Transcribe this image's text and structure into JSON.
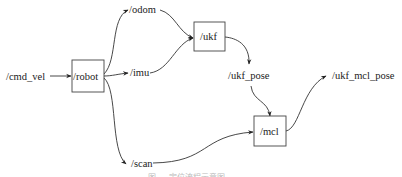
{
  "diagram": {
    "nodes": {
      "cmd_vel": "/cmd_vel",
      "robot": "/robot",
      "odom": "/odom",
      "imu": "/imu",
      "scan": "/scan",
      "ukf": "/ukf",
      "ukf_pose": "/ukf_pose",
      "mcl": "/mcl",
      "ukf_mcl_pose": "/ukf_mcl_pose"
    },
    "boxed_nodes": [
      "/robot",
      "/ukf",
      "/mcl"
    ],
    "edges": [
      [
        "/cmd_vel",
        "/robot"
      ],
      [
        "/robot",
        "/odom"
      ],
      [
        "/robot",
        "/imu"
      ],
      [
        "/robot",
        "/scan"
      ],
      [
        "/odom",
        "/ukf"
      ],
      [
        "/imu",
        "/ukf"
      ],
      [
        "/ukf",
        "/ukf_pose"
      ],
      [
        "/ukf_pose",
        "/mcl"
      ],
      [
        "/scan",
        "/mcl"
      ],
      [
        "/mcl",
        "/ukf_mcl_pose"
      ]
    ],
    "caption": "图 ... 定位流程示意图"
  }
}
